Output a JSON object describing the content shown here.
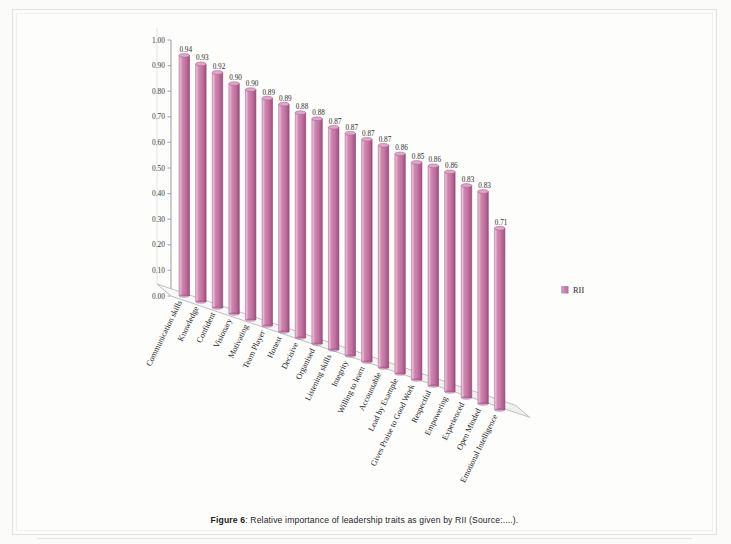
{
  "figure": {
    "caption_label": "Figure 6",
    "caption_separator": ": ",
    "caption_text": "Relative importance of leadership traits as given by RII (Source:....)."
  },
  "legend": {
    "position": "right",
    "entries": [
      {
        "label": "RII",
        "color": "#c089b4"
      }
    ]
  },
  "colors": {
    "bar_light": "#e3b3d0",
    "bar_mid": "#c3739f",
    "bar_dark": "#a85687",
    "bar_top": "#d9a3c4",
    "axis": "#9a9a9a",
    "floor": "#f7f6f5",
    "text": "#262626"
  },
  "chart_data": {
    "type": "bar",
    "title": "",
    "xlabel": "",
    "ylabel": "",
    "ylim": [
      0.0,
      1.0
    ],
    "ytick_interval": 0.1,
    "grid": false,
    "legend_position": "right",
    "three_d": true,
    "tick_labels": [
      "0.00",
      "0.10",
      "0.20",
      "0.30",
      "0.40",
      "0.50",
      "0.60",
      "0.70",
      "0.80",
      "0.90",
      "1.00"
    ],
    "series_name": "RII",
    "categories": [
      "Communication skills",
      "Knowledge",
      "Confident",
      "Visionary",
      "Motivating",
      "Team Player",
      "Honest",
      "Decisive",
      "Organised",
      "Listening skills",
      "Integrity",
      "Willing to learn",
      "Accountable",
      "Lead by Example",
      "Gives Praise to Good Work",
      "Respectful",
      "Empowering",
      "Experienced",
      "Open Minded",
      "Emotional Intelligence"
    ],
    "values": [
      0.94,
      0.93,
      0.92,
      0.9,
      0.9,
      0.89,
      0.89,
      0.88,
      0.88,
      0.87,
      0.87,
      0.87,
      0.87,
      0.86,
      0.85,
      0.86,
      0.86,
      0.83,
      0.83,
      0.71
    ],
    "value_labels": [
      "0.94",
      "0.93",
      "0.92",
      "0.90",
      "0.90",
      "0.89",
      "0.89",
      "0.88",
      "0.88",
      "0.87",
      "0.87",
      "0.87",
      "0.87",
      "0.86",
      "0.85",
      "0.86",
      "0.86",
      "0.83",
      "0.83",
      "0.71"
    ]
  }
}
